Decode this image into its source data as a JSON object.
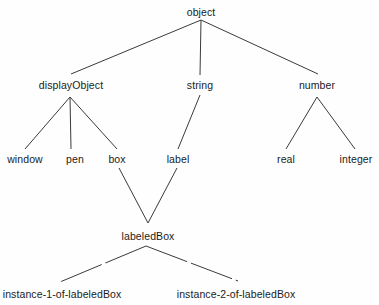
{
  "diagram": {
    "type": "tree",
    "background_color": "#fefefe",
    "line_color": "#3a3a3a",
    "text_color": "#1b1b1b",
    "nodes": [
      {
        "id": "object",
        "label": "object",
        "x": 201,
        "y": 12,
        "level": 0
      },
      {
        "id": "displayObject",
        "label": "displayObject",
        "x": 71,
        "y": 85,
        "level": 1
      },
      {
        "id": "string",
        "label": "string",
        "x": 200,
        "y": 85,
        "level": 1
      },
      {
        "id": "number",
        "label": "number",
        "x": 317,
        "y": 85,
        "level": 1
      },
      {
        "id": "window",
        "label": "window",
        "x": 25,
        "y": 159,
        "level": 2
      },
      {
        "id": "pen",
        "label": "pen",
        "x": 75,
        "y": 159,
        "level": 2
      },
      {
        "id": "box",
        "label": "box",
        "x": 117,
        "y": 159,
        "level": 2
      },
      {
        "id": "label",
        "label": "label",
        "x": 178,
        "y": 159,
        "level": 2
      },
      {
        "id": "real",
        "label": "real",
        "x": 286,
        "y": 159,
        "level": 2
      },
      {
        "id": "integer",
        "label": "integer",
        "x": 356,
        "y": 159,
        "level": 2
      },
      {
        "id": "labeledBox",
        "label": "labeledBox",
        "x": 148,
        "y": 236,
        "level": 3
      },
      {
        "id": "instance1",
        "label": "instance-1-of-labeledBox",
        "x": 62,
        "y": 294,
        "level": 4
      },
      {
        "id": "instance2",
        "label": "instance-2-of-labeledBox",
        "x": 236,
        "y": 294,
        "level": 4
      }
    ],
    "edges": [
      {
        "from": "object",
        "to": "displayObject",
        "style": "solid",
        "x1": 201,
        "y1": 20,
        "x2": 71,
        "y2": 74
      },
      {
        "from": "object",
        "to": "string",
        "style": "solid",
        "x1": 201,
        "y1": 20,
        "x2": 200,
        "y2": 75
      },
      {
        "from": "object",
        "to": "number",
        "style": "solid",
        "x1": 201,
        "y1": 20,
        "x2": 318,
        "y2": 74
      },
      {
        "from": "displayObject",
        "to": "window",
        "style": "solid",
        "x1": 70,
        "y1": 97,
        "x2": 25,
        "y2": 149
      },
      {
        "from": "displayObject",
        "to": "pen",
        "style": "solid",
        "x1": 70,
        "y1": 97,
        "x2": 71,
        "y2": 149
      },
      {
        "from": "displayObject",
        "to": "box",
        "style": "solid",
        "x1": 70,
        "y1": 97,
        "x2": 117,
        "y2": 149
      },
      {
        "from": "string",
        "to": "label",
        "style": "solid",
        "x1": 200,
        "y1": 95,
        "x2": 178,
        "y2": 149
      },
      {
        "from": "number",
        "to": "real",
        "style": "solid",
        "x1": 317,
        "y1": 97,
        "x2": 286,
        "y2": 149
      },
      {
        "from": "number",
        "to": "integer",
        "style": "solid",
        "x1": 317,
        "y1": 97,
        "x2": 355,
        "y2": 149
      },
      {
        "from": "box",
        "to": "labeledBox",
        "style": "solid",
        "x1": 119,
        "y1": 168,
        "x2": 148,
        "y2": 223
      },
      {
        "from": "label",
        "to": "labeledBox",
        "style": "solid",
        "x1": 177,
        "y1": 168,
        "x2": 148,
        "y2": 223
      },
      {
        "from": "labeledBox",
        "to": "instance1",
        "style": "dashed",
        "x1": 146,
        "y1": 246,
        "x2": 60,
        "y2": 282
      },
      {
        "from": "labeledBox",
        "to": "instance2",
        "style": "dashed",
        "x1": 146,
        "y1": 246,
        "x2": 238,
        "y2": 281
      }
    ]
  }
}
